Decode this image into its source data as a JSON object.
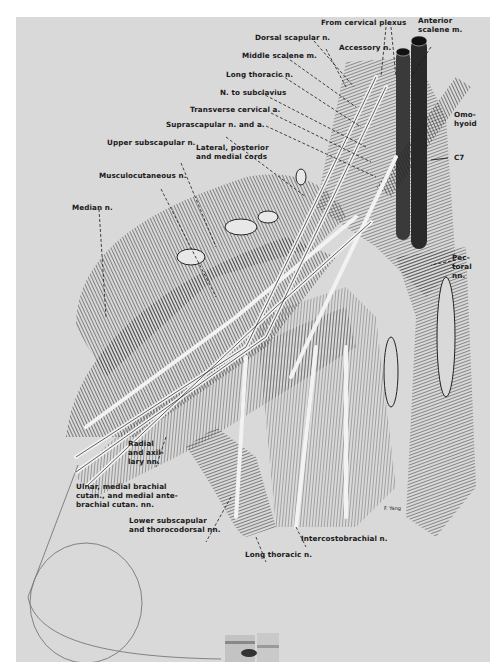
{
  "figure": {
    "signature": "F. Yang",
    "labels": [
      {
        "id": "from-cervical-plexus",
        "text": "From cervical plexus"
      },
      {
        "id": "anterior-scalene",
        "text": "Anterior\nscalene m."
      },
      {
        "id": "dorsal-scapular",
        "text": "Dorsal scapular n."
      },
      {
        "id": "accessory",
        "text": "Accessory n."
      },
      {
        "id": "middle-scalene",
        "text": "Middle scalene m."
      },
      {
        "id": "long-thoracic-top",
        "text": "Long thoracic n."
      },
      {
        "id": "n-to-subclavius",
        "text": "N. to subclavius"
      },
      {
        "id": "transverse-cervical",
        "text": "Transverse cervical a."
      },
      {
        "id": "suprascapular",
        "text": "Suprascapular n. and a."
      },
      {
        "id": "omohyoid",
        "text": "Omo-\nhyoid"
      },
      {
        "id": "upper-subscapular",
        "text": "Upper subscapular n."
      },
      {
        "id": "cords",
        "text": "Lateral, posterior\nand medial cords"
      },
      {
        "id": "c7",
        "text": "C7"
      },
      {
        "id": "musculocutaneous",
        "text": "Musculocutaneous n."
      },
      {
        "id": "median",
        "text": "Median n."
      },
      {
        "id": "pectoral",
        "text": "Pec-\ntoral\nnn."
      },
      {
        "id": "radial-axillary",
        "text": "Radial\nand axil-\nlary nn."
      },
      {
        "id": "ulnar",
        "text": "Ulnar, medial brachial\ncutan., and medial ante-\nbrachial cutan. nn."
      },
      {
        "id": "lower-subscapular",
        "text": "Lower subscapular\nand thorocodorsal nn."
      },
      {
        "id": "intercostobrachial",
        "text": "Intercostobrachial n."
      },
      {
        "id": "long-thoracic-bottom",
        "text": "Long thoracic n."
      }
    ]
  },
  "colors": {
    "background": "#d9d9d9",
    "ink": "#1a1a1a",
    "margin": "#ffffff"
  }
}
